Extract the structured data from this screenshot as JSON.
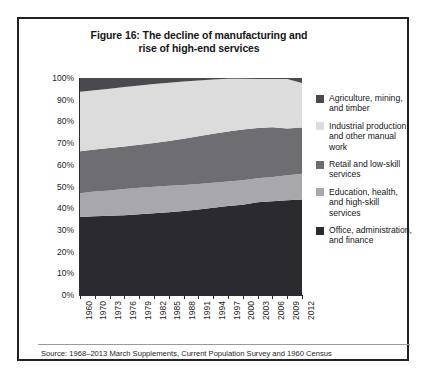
{
  "figure": {
    "title_line1": "Figure 16: The decline of manufacturing and",
    "title_line2": "rise of high-end services",
    "source": "Source: 1968–2013 March Supplements, Current Population Survey and 1960 Census"
  },
  "legend": {
    "items": [
      {
        "label": "Agriculture, mining, and timber",
        "color": "#4a4a4e"
      },
      {
        "label": "Industrial production and other manual work",
        "color": "#dcdcdc"
      },
      {
        "label": "Retail and low-skill services",
        "color": "#6e6e72"
      },
      {
        "label": "Education, health, and high-skill services",
        "color": "#a8a8ac"
      },
      {
        "label": "Office, administration, and finance",
        "color": "#2b2b2f"
      }
    ]
  },
  "chart_data": {
    "type": "area",
    "title": "Figure 16: The decline of manufacturing and rise of high-end services",
    "xlabel": "",
    "ylabel": "",
    "ylim": [
      0,
      100
    ],
    "xlim": [
      1960,
      2012
    ],
    "stacked": true,
    "normalized_percent": true,
    "grid": false,
    "legend_position": "right",
    "ytick_labels": [
      "0%",
      "10%",
      "20%",
      "30%",
      "40%",
      "50%",
      "60%",
      "70%",
      "80%",
      "90%",
      "100%"
    ],
    "ytick_values": [
      0,
      10,
      20,
      30,
      40,
      50,
      60,
      70,
      80,
      90,
      100
    ],
    "xtick_labels": [
      "1960",
      "1970",
      "1973",
      "1976",
      "1979",
      "1982",
      "1985",
      "1988",
      "1991",
      "1994",
      "1997",
      "2000",
      "2003",
      "2006",
      "2009",
      "2012"
    ],
    "x": [
      1960,
      1970,
      1973,
      1976,
      1979,
      1982,
      1985,
      1988,
      1991,
      1994,
      1997,
      2000,
      2003,
      2006,
      2009,
      2012
    ],
    "series": [
      {
        "name": "Office, administration, and finance",
        "color": "#2b2b2f",
        "stack_order": 1,
        "values": [
          36.0,
          36.5,
          36.8,
          37.2,
          37.6,
          38.0,
          38.4,
          38.8,
          39.3,
          40.0,
          40.6,
          41.2,
          42.3,
          42.9,
          43.5,
          44.0
        ]
      },
      {
        "name": "Education, health, and high-skill services",
        "color": "#a8a8ac",
        "stack_order": 2,
        "values": [
          11.0,
          11.1,
          11.2,
          11.3,
          11.4,
          11.5,
          11.6,
          11.7,
          11.8,
          11.9,
          12.0,
          12.1,
          11.9,
          11.8,
          11.9,
          12.0
        ]
      },
      {
        "name": "Retail and low-skill services",
        "color": "#6e6e72",
        "stack_order": 3,
        "values": [
          19.0,
          19.4,
          19.8,
          20.2,
          20.6,
          21.0,
          21.4,
          21.8,
          22.2,
          22.4,
          22.6,
          22.6,
          22.4,
          22.2,
          21.0,
          21.0
        ]
      },
      {
        "name": "Industrial production and other manual work",
        "color": "#dcdcdc",
        "stack_order": 4,
        "values": [
          28.0,
          27.6,
          27.3,
          27.0,
          26.6,
          26.3,
          26.0,
          25.7,
          25.3,
          24.9,
          24.5,
          24.0,
          23.3,
          23.0,
          23.5,
          21.0
        ]
      },
      {
        "name": "Agriculture, mining, and timber",
        "color": "#4a4a4e",
        "stack_order": 5,
        "values": [
          6.0,
          5.4,
          4.9,
          4.3,
          3.8,
          3.2,
          2.6,
          2.0,
          1.4,
          0.8,
          0.3,
          0.1,
          0.1,
          0.1,
          0.1,
          2.0
        ]
      }
    ],
    "boundaries_cumulative_percent": {
      "office_top": [
        36.0,
        36.5,
        36.8,
        37.2,
        37.6,
        38.0,
        38.4,
        38.8,
        39.3,
        40.0,
        40.6,
        41.2,
        42.3,
        42.9,
        43.5,
        44.0
      ],
      "education_top": [
        47.0,
        47.6,
        48.0,
        48.5,
        49.0,
        49.5,
        50.0,
        50.5,
        51.1,
        51.9,
        52.6,
        53.3,
        54.2,
        54.7,
        55.4,
        56.0
      ],
      "retail_top": [
        66.0,
        67.0,
        67.8,
        68.7,
        69.6,
        70.5,
        71.4,
        72.3,
        73.3,
        74.3,
        75.2,
        75.9,
        76.6,
        76.9,
        76.4,
        77.0
      ],
      "industrial_top": [
        94.0,
        94.6,
        95.1,
        95.7,
        96.2,
        96.8,
        97.4,
        98.0,
        98.6,
        99.2,
        99.7,
        99.9,
        99.9,
        99.9,
        99.9,
        98.0
      ],
      "agriculture_top": [
        100,
        100,
        100,
        100,
        100,
        100,
        100,
        100,
        100,
        100,
        100,
        100,
        100,
        100,
        100,
        100
      ]
    }
  }
}
